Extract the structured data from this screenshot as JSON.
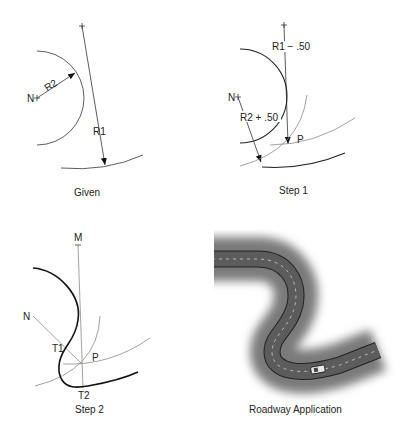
{
  "panels": {
    "given": {
      "caption": "Given",
      "labels": {
        "n": "N",
        "r1": "R1",
        "r2": "R2"
      }
    },
    "step1": {
      "caption": "Step 1",
      "labels": {
        "n": "N",
        "r1_offset": "R1 − .50",
        "r2_offset": "R2 + .50",
        "p": "P"
      }
    },
    "step2": {
      "caption": "Step 2",
      "labels": {
        "m": "M",
        "n": "N",
        "t1": "T1",
        "t2": "T2",
        "p": "P"
      }
    },
    "roadway": {
      "caption": "Roadway Application",
      "icons": {
        "car": "car-icon"
      },
      "colors": {
        "road": "#5a5a5a",
        "edge": "#222222",
        "shadow": "#6e6e6e",
        "center_line": "#d8d8d8"
      }
    }
  }
}
